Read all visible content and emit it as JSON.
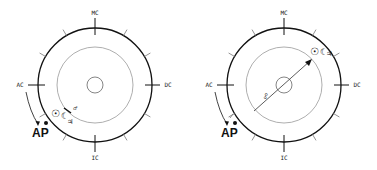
{
  "diagrams": [
    {
      "id": "left",
      "center": [
        95,
        85
      ],
      "outer_radius": 57,
      "inner_radius": 38,
      "core_radius": 8,
      "angles": {
        "MC": "MC",
        "IC": "IC",
        "AC": "AC",
        "DC": "DC"
      },
      "arrow_label": "AP",
      "planets": {
        "sun": "☉",
        "moon": "☾",
        "jupiter": "♃",
        "mars": "♂"
      }
    },
    {
      "id": "right",
      "center": [
        284,
        85
      ],
      "outer_radius": 57,
      "inner_radius": 38,
      "core_radius": 8,
      "angles": {
        "MC": "MC",
        "IC": "IC",
        "AC": "AC",
        "DC": "DC"
      },
      "arrow_label": "AP",
      "planets": {
        "sun": "☉",
        "moon": "☾",
        "jupiter": "♃"
      },
      "aspect_label": "☍"
    }
  ],
  "colors": {
    "stroke": "#111111",
    "inner_stroke": "#888888",
    "background": "#ffffff"
  }
}
